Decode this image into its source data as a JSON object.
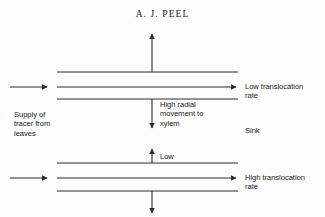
{
  "figure": {
    "title": "A. J. PEEL",
    "labels": {
      "supply": "Supply of\ntracer from\nleaves",
      "radial_movement": "High radial\nmovement to\nxylem",
      "low": "Low",
      "low_translocation": "Low translocation\nrate",
      "sink": "Sink",
      "high_translocation": "High translocation\nrate"
    },
    "colors": {
      "line": "#2b2b2b",
      "text": "#1a1a1a",
      "background": "#fdfdfd"
    }
  }
}
